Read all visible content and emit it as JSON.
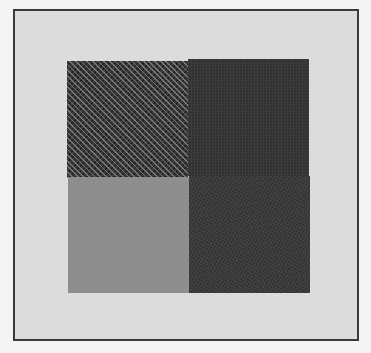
{
  "figure": {
    "type": "texture-stimulus",
    "frame": {
      "border_color": "#3a3a3a",
      "background": "#dcdcdc"
    },
    "quadrants": [
      {
        "position": "top-left",
        "texture": "herringbone-pattern",
        "color": "#3a3a3a"
      },
      {
        "position": "top-right",
        "texture": "fine-noise",
        "color": "#363636"
      },
      {
        "position": "bottom-left",
        "texture": "uniform-gray",
        "color": "#8e8e8e"
      },
      {
        "position": "bottom-right",
        "texture": "fine-noise",
        "color": "#3c3c3c"
      }
    ]
  }
}
